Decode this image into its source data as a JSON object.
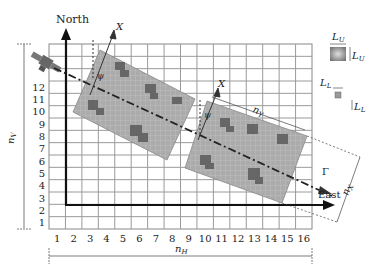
{
  "diagram": {
    "axes": {
      "north_label": "North",
      "east_label": "East"
    },
    "grid": {
      "columns": 16,
      "rows": 15,
      "x_tick_labels": [
        "1",
        "2",
        "3",
        "4",
        "5",
        "6",
        "7",
        "8",
        "9",
        "10",
        "11",
        "12",
        "13",
        "14",
        "15",
        "16"
      ],
      "y_tick_labels": [
        "1",
        "2",
        "3",
        "4",
        "5",
        "6",
        "7",
        "8",
        "9",
        "10",
        "11",
        "12"
      ]
    },
    "dimension_labels": {
      "n_h": "n",
      "n_h_sub": "H",
      "n_v": "n",
      "n_v_sub": "V",
      "n_x": "n",
      "n_x_sub": "X",
      "n_y": "n",
      "n_y_sub": "Y"
    },
    "swath_labels": {
      "x_axis": "X",
      "angle": "ψ",
      "track": "Γ"
    },
    "legend": {
      "upper_cell_label": "L",
      "upper_cell_sub": "U",
      "lower_cell_label": "L",
      "lower_cell_sub": "L"
    },
    "colors": {
      "grid_line": "#9a9a9a",
      "swath_fill": "#a8a8a8",
      "swath_dark": "#555555",
      "axis": "#111111"
    }
  }
}
